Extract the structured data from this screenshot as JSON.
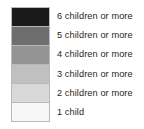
{
  "legend": {
    "title": "",
    "orientation": "vertical",
    "background_color": "#ffffff",
    "text_color": "#1f1f1f",
    "border_color": "#b9b9b9",
    "entries": [
      {
        "label": "6 children or more",
        "color": "#1a1a1a"
      },
      {
        "label": "5 children or more",
        "color": "#6e6e6e"
      },
      {
        "label": "4 children or more",
        "color": "#949494"
      },
      {
        "label": "3 children or more",
        "color": "#c0c0c0"
      },
      {
        "label": "2 children or more",
        "color": "#d8d8d8"
      },
      {
        "label": "1 child",
        "color": "#f7f7f7"
      }
    ]
  }
}
